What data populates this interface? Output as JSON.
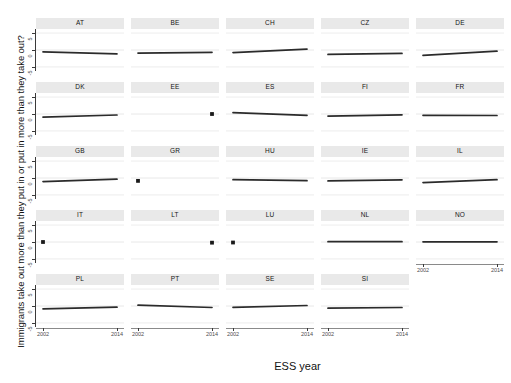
{
  "chart_data": {
    "type": "line",
    "title": "",
    "xlabel": "ESS year",
    "ylabel": "Immigrants take out more than they put in or put in more than they take out?",
    "x": [
      2002,
      2014
    ],
    "xlim": [
      2002,
      2014
    ],
    "ylim": [
      -6.2,
      6.2
    ],
    "yticks": [
      5,
      0,
      -5
    ],
    "ytick_labels": [
      "5",
      "0",
      "-5"
    ],
    "xticks": [
      2002,
      2014
    ],
    "xtick_labels": [
      "2002",
      "2014"
    ],
    "grid": true,
    "legend": "none",
    "facet_layout": {
      "rows": 5,
      "cols": 5
    },
    "line_color": "#2b2b2b",
    "point_color": "#1a1a1a",
    "strip_background": "#e9e9e9",
    "panel_background": "#ffffff",
    "gridline_color": "#e8e8e8",
    "facets": [
      {
        "name": "AT",
        "row": 1,
        "col": 1,
        "values": [
          -0.55,
          -1.15
        ]
      },
      {
        "name": "BE",
        "row": 1,
        "col": 2,
        "values": [
          -0.9,
          -0.7
        ]
      },
      {
        "name": "CH",
        "row": 1,
        "col": 3,
        "values": [
          -0.75,
          0.25
        ]
      },
      {
        "name": "CZ",
        "row": 1,
        "col": 4,
        "values": [
          -1.3,
          -1.0
        ]
      },
      {
        "name": "DE",
        "row": 1,
        "col": 5,
        "values": [
          -1.6,
          -0.35
        ]
      },
      {
        "name": "DK",
        "row": 2,
        "col": 1,
        "values": [
          -0.95,
          -0.3
        ]
      },
      {
        "name": "EE",
        "row": 2,
        "col": 2,
        "values": [
          null,
          0.0
        ]
      },
      {
        "name": "ES",
        "row": 2,
        "col": 3,
        "values": [
          0.4,
          -0.4
        ]
      },
      {
        "name": "FI",
        "row": 2,
        "col": 4,
        "values": [
          -0.6,
          -0.25
        ]
      },
      {
        "name": "FR",
        "row": 2,
        "col": 5,
        "values": [
          -0.4,
          -0.45
        ]
      },
      {
        "name": "GB",
        "row": 3,
        "col": 1,
        "values": [
          -1.05,
          -0.35
        ]
      },
      {
        "name": "GR",
        "row": 3,
        "col": 2,
        "values": [
          -0.85,
          null
        ]
      },
      {
        "name": "HU",
        "row": 3,
        "col": 3,
        "values": [
          -0.5,
          -0.8
        ]
      },
      {
        "name": "IE",
        "row": 3,
        "col": 4,
        "values": [
          -0.85,
          -0.55
        ]
      },
      {
        "name": "IL",
        "row": 3,
        "col": 5,
        "values": [
          -1.35,
          -0.5
        ]
      },
      {
        "name": "IT",
        "row": 4,
        "col": 1,
        "values": [
          0.0,
          null
        ]
      },
      {
        "name": "LT",
        "row": 4,
        "col": 2,
        "values": [
          null,
          -0.2
        ]
      },
      {
        "name": "LU",
        "row": 4,
        "col": 3,
        "values": [
          -0.15,
          null
        ]
      },
      {
        "name": "NL",
        "row": 4,
        "col": 4,
        "values": [
          0.1,
          0.1
        ]
      },
      {
        "name": "NO",
        "row": 4,
        "col": 5,
        "values": [
          0.05,
          0.05
        ]
      },
      {
        "name": "PL",
        "row": 5,
        "col": 1,
        "values": [
          -0.85,
          -0.35
        ]
      },
      {
        "name": "PT",
        "row": 5,
        "col": 2,
        "values": [
          0.25,
          -0.45
        ]
      },
      {
        "name": "SE",
        "row": 5,
        "col": 3,
        "values": [
          -0.4,
          0.15
        ]
      },
      {
        "name": "SI",
        "row": 5,
        "col": 4,
        "values": [
          -0.65,
          -0.45
        ]
      }
    ]
  }
}
